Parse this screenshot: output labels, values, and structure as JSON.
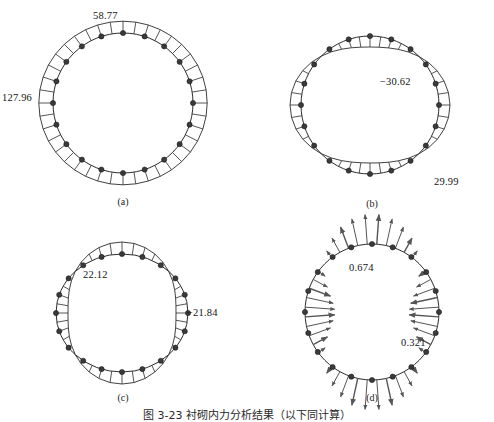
{
  "figure": {
    "caption": "图 3-23  衬砌内力分析结果（以下同计算）",
    "background": "#ffffff",
    "line_color": "#2b2b2b",
    "node_color": "#3a3a3a",
    "arrow_color": "#555555"
  },
  "panels": [
    {
      "id": "a",
      "label": "(a)",
      "title_hidden": "Axial force diagram",
      "cx": 123,
      "cy": 103,
      "rx": 70,
      "ry": 70,
      "n_bars": 40,
      "n_nodes": 20,
      "pattern": "uniform",
      "amp": 13,
      "base": 13,
      "phase": 0,
      "harmonic": 0,
      "bar_side": "outside",
      "values": [
        {
          "text": "58.77",
          "x": 93,
          "y": 10,
          "anchor": "start"
        },
        {
          "text": "127.96",
          "x": 2,
          "y": 92,
          "anchor": "start"
        }
      ]
    },
    {
      "id": "b",
      "label": "(b)",
      "title_hidden": "Shear force diagram",
      "cx": 370,
      "cy": 105,
      "rx": 69,
      "ry": 69,
      "n_bars": 40,
      "n_nodes": 20,
      "pattern": "harmonic",
      "amp": 11,
      "base": 0,
      "phase": 0.78,
      "harmonic": 2,
      "bar_side": "signed",
      "values": [
        {
          "text": "−30.62",
          "x": 380,
          "y": 76,
          "anchor": "start"
        },
        {
          "text": "29.99",
          "x": 434,
          "y": 176,
          "anchor": "start"
        }
      ]
    },
    {
      "id": "c",
      "label": "(c)",
      "title_hidden": "Bending moment diagram",
      "cx": 122,
      "cy": 313,
      "rx": 66,
      "ry": 59,
      "n_bars": 40,
      "n_nodes": 20,
      "pattern": "harmonic",
      "amp": 12,
      "base": 0,
      "phase": 0,
      "harmonic": 2,
      "bar_side": "signed_cos",
      "values": [
        {
          "text": "22.12",
          "x": 83,
          "y": 269,
          "anchor": "start"
        },
        {
          "text": "−21.84",
          "x": 187,
          "y": 307,
          "anchor": "start"
        }
      ]
    },
    {
      "id": "d",
      "label": "(d)",
      "title_hidden": "Deformation / reaction arrows",
      "cx": 372,
      "cy": 312,
      "rx": 67,
      "ry": 68,
      "n_bars": 44,
      "n_nodes": 20,
      "pattern": "arrows",
      "amp": 30,
      "base": 0,
      "phase": 0,
      "harmonic": 2,
      "bar_side": "arrows",
      "values": [
        {
          "text": "0.674",
          "x": 349,
          "y": 262,
          "anchor": "start"
        },
        {
          "text": "0.321",
          "x": 401,
          "y": 337,
          "anchor": "start"
        }
      ]
    }
  ],
  "panel_labels": [
    {
      "text": "(a)",
      "x": 103,
      "y": 196
    },
    {
      "text": "(b)",
      "x": 352,
      "y": 198
    },
    {
      "text": "(c)",
      "x": 103,
      "y": 392
    },
    {
      "text": "(d)",
      "x": 352,
      "y": 392
    }
  ],
  "chart_data": {
    "type": "line",
    "subplots": [
      {
        "id": "a",
        "name": "Axial force N (kN)",
        "shape": "circle",
        "distribution": "nearly uniform outward hatching",
        "extremes": [
          {
            "label": "58.77",
            "location": "crown (top)",
            "value": 58.77
          },
          {
            "label": "127.96",
            "location": "springline (left)",
            "value": 127.96
          }
        ],
        "bars": 40,
        "nodes": 20
      },
      {
        "id": "b",
        "name": "Shear force Q (kN)",
        "shape": "circle",
        "distribution": "antisymmetric two-lobe (sin 2θ)",
        "extremes": [
          {
            "label": "−30.62",
            "location": "upper right",
            "value": -30.62
          },
          {
            "label": "29.99",
            "location": "lower right",
            "value": 29.99
          }
        ],
        "bars": 40,
        "nodes": 20
      },
      {
        "id": "c",
        "name": "Bending moment M (kN·m)",
        "shape": "oval",
        "distribution": "cos 2θ: inside at crown/invert, outside at springlines",
        "extremes": [
          {
            "label": "22.12",
            "location": "crown (top)",
            "value": 22.12
          },
          {
            "label": "−21.84",
            "location": "springline (right)",
            "value": -21.84
          }
        ],
        "bars": 40,
        "nodes": 20
      },
      {
        "id": "d",
        "name": "Displacement / reaction vectors (mm)",
        "shape": "circle",
        "distribution": "inward at crown & invert, outward at springlines",
        "extremes": [
          {
            "label": "0.674",
            "location": "crown (top)",
            "value": 0.674
          },
          {
            "label": "0.321",
            "location": "lower right",
            "value": 0.321
          }
        ],
        "bars": 44,
        "nodes": 20
      }
    ]
  }
}
